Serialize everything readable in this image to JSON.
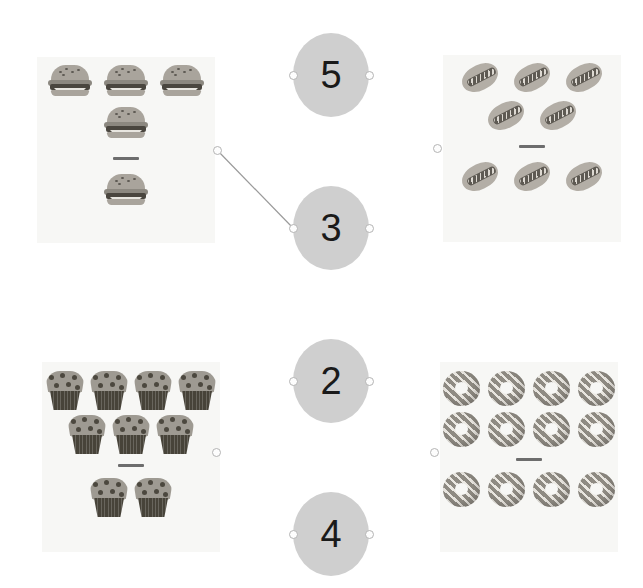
{
  "page": {
    "background_color": "#ffffff",
    "width": 643,
    "height": 588
  },
  "style": {
    "panel_background": "#f7f7f5",
    "circle_fill": "#cfcfcf",
    "circle_text_color": "#1a1a1a",
    "divider_color": "#6d6d6d",
    "anchor_fill": "#fdfdfd",
    "anchor_border": "#b4b4b4",
    "link_line_color": "#9a9a9a"
  },
  "panels": [
    {
      "id": "burgers",
      "item_name": "hamburger",
      "icon": "burger-icon",
      "x": 37,
      "y": 57,
      "width": 178,
      "height": 186,
      "dividend": 4,
      "divisor": 1,
      "rows_above": [
        3,
        1
      ],
      "rows_below": [
        1
      ],
      "total_above": 4,
      "total_below": 1,
      "quotient": 4,
      "divider_label": "division-bar"
    },
    {
      "id": "hotdogs",
      "item_name": "hot dog",
      "icon": "hotdog-icon",
      "x": 443,
      "y": 55,
      "width": 178,
      "height": 187,
      "dividend": 5,
      "divisor": 3,
      "rows_above": [
        3,
        2
      ],
      "rows_below": [
        3
      ],
      "total_above": 5,
      "total_below": 3,
      "divider_label": "division-bar"
    },
    {
      "id": "muffins",
      "item_name": "muffin",
      "icon": "muffin-icon",
      "x": 42,
      "y": 362,
      "width": 178,
      "height": 190,
      "dividend": 7,
      "divisor": 2,
      "rows_above": [
        4,
        3
      ],
      "rows_below": [
        2
      ],
      "total_above": 7,
      "total_below": 2,
      "divider_label": "division-bar"
    },
    {
      "id": "donuts",
      "item_name": "donut",
      "icon": "donut-icon",
      "x": 440,
      "y": 362,
      "width": 178,
      "height": 190,
      "dividend": 8,
      "divisor": 4,
      "rows_above": [
        4,
        4
      ],
      "rows_below": [
        4
      ],
      "total_above": 8,
      "total_below": 4,
      "divider_label": "division-bar"
    }
  ],
  "number_circles": [
    {
      "id": "circle-5",
      "value": "5",
      "cx": 331,
      "cy": 75,
      "rx": 38,
      "ry": 42
    },
    {
      "id": "circle-3",
      "value": "3",
      "cx": 331,
      "cy": 228,
      "rx": 38,
      "ry": 42
    },
    {
      "id": "circle-2",
      "value": "2",
      "cx": 331,
      "cy": 381,
      "rx": 38,
      "ry": 42
    },
    {
      "id": "circle-4",
      "value": "4",
      "cx": 331,
      "cy": 534,
      "rx": 38,
      "ry": 42
    }
  ],
  "anchors": [
    {
      "id": "anchor-burgers-right",
      "x": 217,
      "y": 150,
      "side": "right",
      "owner": "burgers"
    },
    {
      "id": "anchor-hotdogs-left",
      "x": 437,
      "y": 148,
      "side": "left",
      "owner": "hotdogs"
    },
    {
      "id": "anchor-muffins-right",
      "x": 216,
      "y": 452,
      "side": "right",
      "owner": "muffins"
    },
    {
      "id": "anchor-donuts-left",
      "x": 434,
      "y": 452,
      "side": "left",
      "owner": "donuts"
    },
    {
      "id": "anchor-circle-5-left",
      "x": 293,
      "y": 75,
      "side": "left",
      "owner": "circle-5"
    },
    {
      "id": "anchor-circle-5-right",
      "x": 369,
      "y": 75,
      "side": "right",
      "owner": "circle-5"
    },
    {
      "id": "anchor-circle-3-left",
      "x": 293,
      "y": 228,
      "side": "left",
      "owner": "circle-3"
    },
    {
      "id": "anchor-circle-3-right",
      "x": 369,
      "y": 228,
      "side": "right",
      "owner": "circle-3"
    },
    {
      "id": "anchor-circle-2-left",
      "x": 293,
      "y": 381,
      "side": "left",
      "owner": "circle-2"
    },
    {
      "id": "anchor-circle-2-right",
      "x": 369,
      "y": 381,
      "side": "right",
      "owner": "circle-2"
    },
    {
      "id": "anchor-circle-4-left",
      "x": 293,
      "y": 534,
      "side": "left",
      "owner": "circle-4"
    },
    {
      "id": "anchor-circle-4-right",
      "x": 369,
      "y": 534,
      "side": "right",
      "owner": "circle-4"
    }
  ],
  "links": [
    {
      "id": "link-burgers-to-3",
      "from": "anchor-burgers-right",
      "to": "anchor-circle-3-left",
      "x1": 217,
      "y1": 150,
      "x2": 293,
      "y2": 228
    }
  ]
}
